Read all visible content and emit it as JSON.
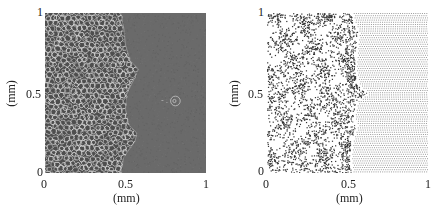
{
  "chart_data": [
    {
      "type": "heatmap",
      "title": "",
      "description": "Grayscale micrograph-style simulation: cellular/foam network on left, uniform dark gray on right, rough front near x=0.5 with small circular feature near (0.8, 0.45)",
      "xlabel": "(mm)",
      "ylabel": "(mm)",
      "xlim": [
        0,
        1
      ],
      "ylim": [
        0,
        1
      ],
      "xticks": [
        "0",
        "0.5",
        "1"
      ],
      "yticks": [
        "0",
        "0.5",
        "1"
      ],
      "front_profile": [
        [
          0.0,
          0.47
        ],
        [
          0.1,
          0.49
        ],
        [
          0.2,
          0.56
        ],
        [
          0.25,
          0.57
        ],
        [
          0.3,
          0.52
        ],
        [
          0.4,
          0.5
        ],
        [
          0.5,
          0.51
        ],
        [
          0.6,
          0.56
        ],
        [
          0.65,
          0.58
        ],
        [
          0.7,
          0.53
        ],
        [
          0.8,
          0.5
        ],
        [
          0.9,
          0.49
        ],
        [
          1.0,
          0.47
        ]
      ],
      "feature": {
        "x": 0.81,
        "y": 0.45,
        "r": 0.03
      },
      "colors": {
        "background": "#6a6a6a",
        "network": "#d8d8d8"
      }
    },
    {
      "type": "scatter",
      "title": "",
      "description": "Particle positions: disordered points on left, regular lattice on right, front near x=0.5 with protrusion near y=0.5",
      "xlabel": "(mm)",
      "ylabel": "(mm)",
      "xlim": [
        0,
        1
      ],
      "ylim": [
        0,
        1
      ],
      "xticks": [
        "0",
        "0.5",
        "1"
      ],
      "yticks": [
        "0",
        "0.5",
        "1"
      ],
      "front_profile": [
        [
          0.0,
          0.52
        ],
        [
          0.1,
          0.51
        ],
        [
          0.2,
          0.52
        ],
        [
          0.3,
          0.55
        ],
        [
          0.35,
          0.53
        ],
        [
          0.45,
          0.55
        ],
        [
          0.5,
          0.62
        ],
        [
          0.55,
          0.56
        ],
        [
          0.65,
          0.54
        ],
        [
          0.8,
          0.55
        ],
        [
          0.88,
          0.56
        ],
        [
          0.95,
          0.53
        ],
        [
          1.0,
          0.52
        ]
      ],
      "colors": {
        "points": "#333333",
        "lattice": "#9a9a9a"
      }
    }
  ]
}
